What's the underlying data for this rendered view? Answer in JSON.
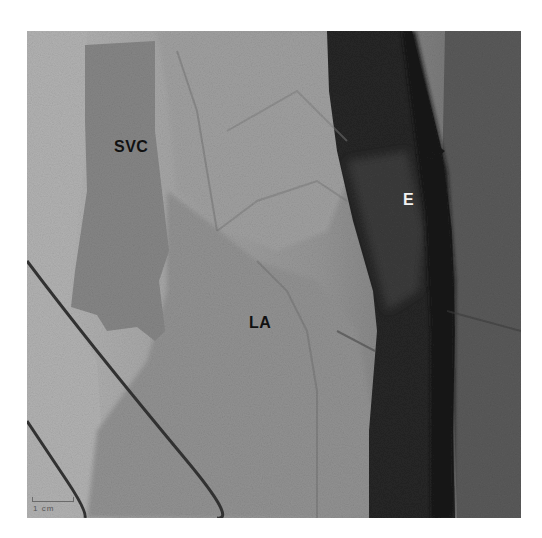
{
  "figure": {
    "labels": {
      "svc": "SVC",
      "esophagus": "E",
      "left_atrium": "LA"
    },
    "scale_bar": {
      "text": "1 cm"
    },
    "colors": {
      "background": "#ffffff",
      "light_tissue": "#b4b4b4",
      "mid_tissue": "#8e8e8e",
      "svc_region": "#858585",
      "dark_band": "#222222",
      "right_tissue": "#5c5c5c",
      "wire": "#3a3a3a",
      "label_dark": "#111111",
      "label_light": "#f2f2f2"
    }
  }
}
